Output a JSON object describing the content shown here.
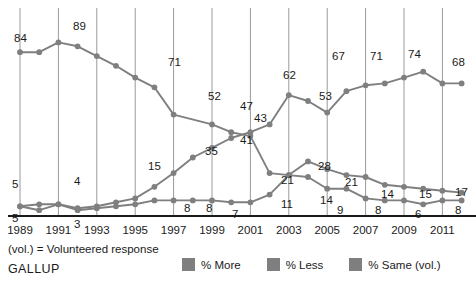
{
  "footnote": "(vol.) = Volunteered response",
  "brand": "GALLUP",
  "colors": {
    "series": "#7f7f7f",
    "gridline": "#9a9a9a",
    "axis": "#1a1a1a",
    "text": "#1a1a1a",
    "background": "#ffffff"
  },
  "legend": {
    "items": [
      {
        "label": "% More",
        "color": "#7f7f7f",
        "swatch": "legend-swatch"
      },
      {
        "label": "% Less",
        "color": "#7f7f7f",
        "swatch": "legend-swatch"
      },
      {
        "label": "% Same (vol.)",
        "color": "#7f7f7f",
        "swatch": "legend-swatch"
      }
    ]
  },
  "chart_data": {
    "type": "line",
    "title": "",
    "xlabel": "",
    "ylabel": "",
    "xlim": [
      1989,
      2012
    ],
    "ylim": [
      0,
      100
    ],
    "grid": "vertical",
    "legend_position": "bottom",
    "tick_labels": [
      "1989",
      "1991",
      "1993",
      "1995",
      "1997",
      "1999",
      "2001",
      "2003",
      "2005",
      "2007",
      "2009",
      "2011"
    ],
    "x": [
      1989,
      1990,
      1991,
      1992,
      1993,
      1994,
      1995,
      1996,
      1997,
      1998,
      1999,
      2000,
      2001,
      2002,
      2003,
      2004,
      2005,
      2006,
      2007,
      2008,
      2009,
      2010,
      2011,
      2012
    ],
    "series": [
      {
        "name": "% More",
        "values": [
          84,
          84,
          89,
          87,
          82,
          77,
          71,
          66,
          52,
          null,
          47,
          43,
          41,
          22,
          21,
          28,
          24,
          21,
          20,
          16,
          15,
          14,
          13,
          12
        ],
        "labels": {
          "1989": "84",
          "1991": "89",
          "1995": "71",
          "1997": "52",
          "1999": "47",
          "2000": "43",
          "2001": "41",
          "2003": "21",
          "2005": "14",
          "2007": "9",
          "2009": "8",
          "2011": "6",
          "2012": "8"
        }
      },
      {
        "name": "% Less",
        "values": [
          5,
          3,
          6,
          4,
          5,
          7,
          9,
          15,
          22,
          30,
          35,
          40,
          43,
          47,
          62,
          59,
          53,
          64,
          67,
          68,
          71,
          74,
          68,
          68
        ],
        "labels": {
          "1989": "5",
          "1992": "4",
          "1996": "15",
          "1999": "35",
          "2000": "43",
          "2001": "47",
          "2003": "62",
          "2005": "53",
          "2006": "67",
          "2008": "71",
          "2010": "74",
          "2012": "68"
        }
      },
      {
        "name": "% Same (vol.)",
        "values": [
          5,
          6,
          6,
          3,
          4,
          5,
          6,
          8,
          8,
          8,
          8,
          7,
          7,
          11,
          21,
          20,
          14,
          14,
          9,
          8,
          8,
          6,
          8,
          8
        ],
        "labels": {
          "1989": "5",
          "1992": "3",
          "1996": "8",
          "1999": "8",
          "2001": "7",
          "2002": "11",
          "2003": "21",
          "2004": "14",
          "2005": "9",
          "2007": "8",
          "2009": "6",
          "2011": "8",
          "2012": "8"
        }
      }
    ],
    "annotated_points": [
      {
        "series": "% More",
        "year": 1989,
        "value": 84,
        "label": "84",
        "lx": 14,
        "ly": 42,
        "px": 20,
        "py": 55
      },
      {
        "series": "% More",
        "year": 1991,
        "value": 89,
        "label": "89",
        "lx": 73,
        "ly": 30,
        "px": 79,
        "py": 44
      },
      {
        "series": "% More",
        "year": 1995,
        "value": 71,
        "label": "71",
        "lx": 168,
        "ly": 66,
        "px": 156,
        "py": 79
      },
      {
        "series": "% More",
        "year": 1997,
        "value": 52,
        "label": "52",
        "lx": 208,
        "ly": 100,
        "px": 194,
        "py": 110
      },
      {
        "series": "% More",
        "year": 1999,
        "value": 47,
        "label": "47",
        "lx": 240,
        "ly": 110,
        "px": 232,
        "py": 122
      },
      {
        "series": "% More",
        "year": 2000,
        "value": 43,
        "label": "43",
        "lx": 254,
        "ly": 122,
        "px": 251,
        "py": 127
      },
      {
        "series": "% More",
        "year": 2001,
        "value": 41,
        "label": "41",
        "lx": 240,
        "ly": 144,
        "px": 232,
        "py": 135
      },
      {
        "series": "% Less",
        "year": 2003,
        "value": 62,
        "label": "62",
        "lx": 283,
        "ly": 79,
        "px": 289,
        "py": 92
      },
      {
        "series": "% Less",
        "year": 2005,
        "value": 53,
        "label": "53",
        "lx": 319,
        "ly": 100,
        "px": 327,
        "py": 112
      },
      {
        "series": "% Less",
        "year": 2006,
        "value": 67,
        "label": "67",
        "lx": 332,
        "ly": 60,
        "px": 346,
        "py": 75
      },
      {
        "series": "% Less",
        "year": 2008,
        "value": 71,
        "label": "71",
        "lx": 370,
        "ly": 60,
        "px": 384,
        "py": 70
      },
      {
        "series": "% Less",
        "year": 2010,
        "value": 74,
        "label": "74",
        "lx": 408,
        "ly": 58,
        "px": 422,
        "py": 65
      },
      {
        "series": "% Less",
        "year": 2012,
        "value": 68,
        "label": "68",
        "lx": 452,
        "ly": 66,
        "px": 461,
        "py": 80
      },
      {
        "series": "% Less",
        "year": 1996,
        "value": 15,
        "label": "15",
        "lx": 148,
        "ly": 170,
        "px": 156,
        "py": 181
      },
      {
        "series": "% Less",
        "year": 1999,
        "value": 35,
        "label": "35",
        "lx": 205,
        "ly": 155,
        "px": 213,
        "py": 163
      },
      {
        "series": "% Less",
        "year": 1989,
        "value": 5,
        "label": "5",
        "lx": 12,
        "ly": 188,
        "px": 20,
        "py": 199
      },
      {
        "series": "% Less",
        "year": 1992,
        "value": 4,
        "label": "4",
        "lx": 74,
        "ly": 185,
        "px": 98,
        "py": 203
      },
      {
        "series": "% More",
        "year": 2003,
        "value": 21,
        "label": "21",
        "lx": 281,
        "ly": 184,
        "px": 289,
        "py": 193
      },
      {
        "series": "% More",
        "year": 2005,
        "value": 28,
        "label": "28",
        "lx": 318,
        "ly": 170,
        "px": 308,
        "py": 180
      },
      {
        "series": "% More",
        "year": 2006,
        "value": 21,
        "label": "21",
        "lx": 345,
        "ly": 186,
        "px": 346,
        "py": 193
      },
      {
        "series": "% More",
        "year": 2008,
        "value": 14,
        "label": "14",
        "lx": 381,
        "ly": 198,
        "px": 384,
        "py": 203
      },
      {
        "series": "% More",
        "year": 2010,
        "value": 15,
        "label": "15",
        "lx": 419,
        "ly": 198,
        "px": 422,
        "py": 203
      },
      {
        "series": "% More",
        "year": 2012,
        "value": 17,
        "label": "17",
        "lx": 455,
        "ly": 196,
        "px": 461,
        "py": 200
      },
      {
        "series": "% Same",
        "year": 1989,
        "value": 5,
        "label": "5",
        "lx": 12,
        "ly": 222,
        "px": 20,
        "py": 208
      },
      {
        "series": "% Same",
        "year": 1992,
        "value": 3,
        "label": "3",
        "lx": 74,
        "ly": 228,
        "px": 98,
        "py": 209
      },
      {
        "series": "% Same",
        "year": 1996,
        "value": 8,
        "label": "8",
        "lx": 184,
        "ly": 212,
        "px": 194,
        "py": 206
      },
      {
        "series": "% Same",
        "year": 1999,
        "value": 8,
        "label": "8",
        "lx": 206,
        "ly": 212,
        "px": 213,
        "py": 205
      },
      {
        "series": "% Same",
        "year": 2001,
        "value": 7,
        "label": "7",
        "lx": 232,
        "ly": 218,
        "px": 251,
        "py": 208
      },
      {
        "series": "% Same",
        "year": 2002,
        "value": 11,
        "label": "11",
        "lx": 281,
        "ly": 208,
        "px": 270,
        "py": 202
      },
      {
        "series": "% Same",
        "year": 2004,
        "value": 14,
        "label": "14",
        "lx": 320,
        "ly": 204,
        "px": 327,
        "py": 197
      },
      {
        "series": "% Same",
        "year": 2005,
        "value": 9,
        "label": "9",
        "lx": 337,
        "ly": 214,
        "px": 346,
        "py": 206
      },
      {
        "series": "% Same",
        "year": 2007,
        "value": 8,
        "label": "8",
        "lx": 375,
        "ly": 214,
        "px": 384,
        "py": 207
      },
      {
        "series": "% Same",
        "year": 2009,
        "value": 6,
        "label": "6",
        "lx": 415,
        "ly": 218,
        "px": 422,
        "py": 210
      },
      {
        "series": "% Same",
        "year": 2011,
        "value": 8,
        "label": "8",
        "lx": 455,
        "ly": 214,
        "px": 461,
        "py": 207
      }
    ]
  }
}
